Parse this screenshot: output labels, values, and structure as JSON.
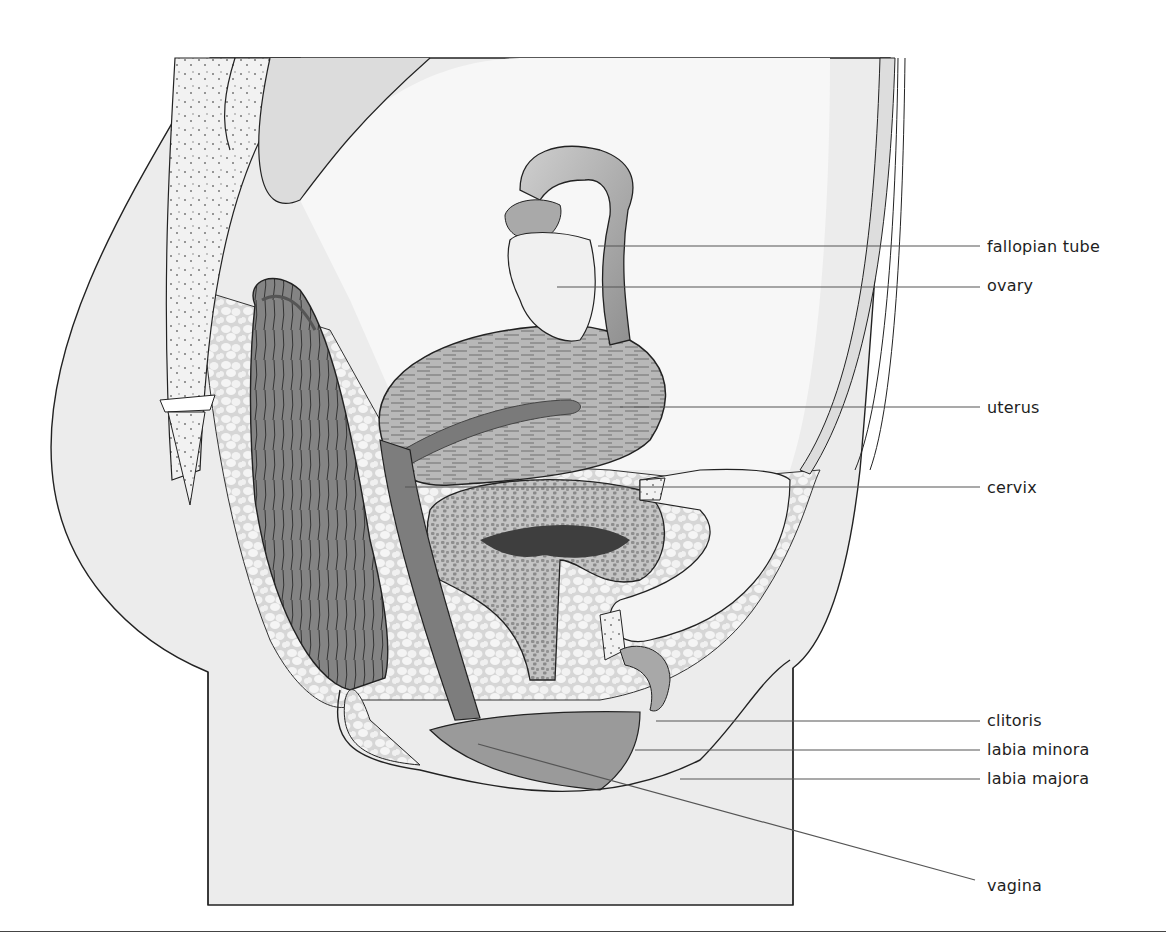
{
  "diagram": {
    "type": "anatomical-illustration",
    "palette": {
      "background": "#ffffff",
      "skin": "#ececec",
      "fat": "#e2e2e2",
      "organ_light": "#c9c9c9",
      "organ_mid": "#a3a3a3",
      "organ_dark": "#6e6e6e",
      "outline": "#222222",
      "leader_line": "#555555",
      "label_text": "#1e1e1e"
    },
    "labels": [
      {
        "text": "fallopian tube",
        "x": 987,
        "y": 237
      },
      {
        "text": "ovary",
        "x": 987,
        "y": 276
      },
      {
        "text": "uterus",
        "x": 987,
        "y": 398
      },
      {
        "text": "cervix",
        "x": 987,
        "y": 480
      },
      {
        "text": "clitoris",
        "x": 987,
        "y": 709
      },
      {
        "text": "labia minora",
        "x": 987,
        "y": 738
      },
      {
        "text": "labia majora",
        "x": 987,
        "y": 767
      },
      {
        "text": "vagina",
        "x": 987,
        "y": 874
      }
    ]
  }
}
